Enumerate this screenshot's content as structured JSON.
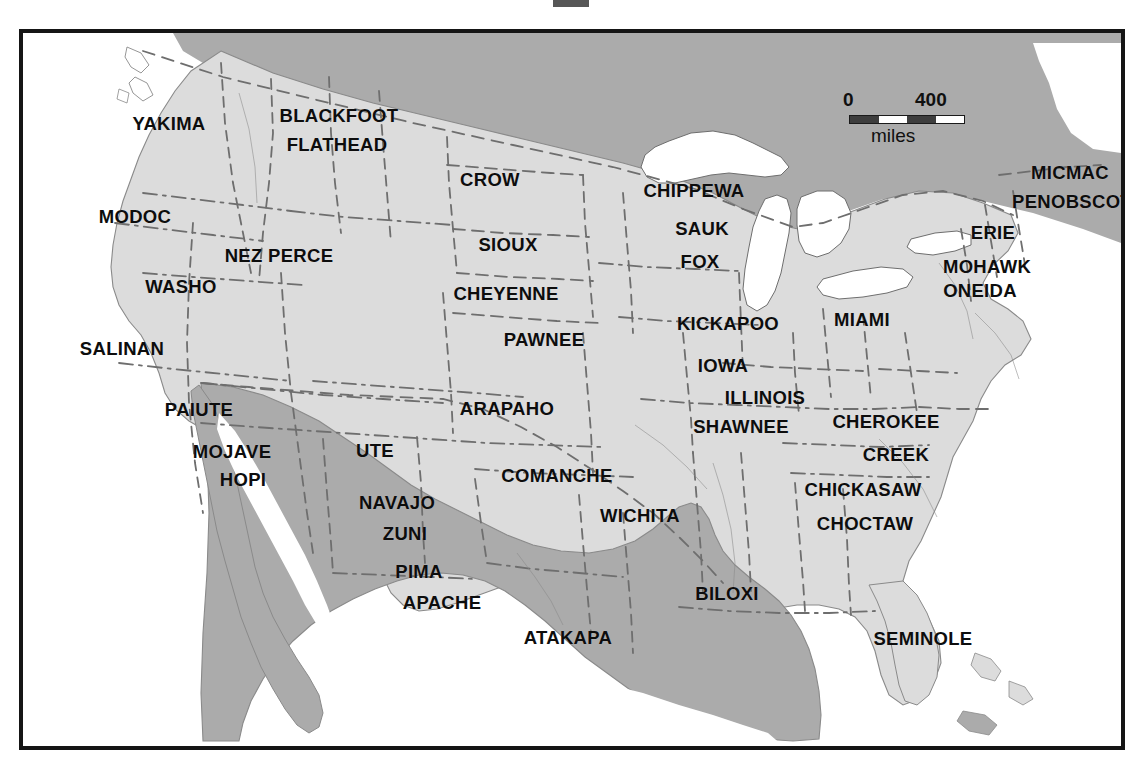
{
  "map": {
    "title_fragment": "",
    "frame": {
      "x": 19,
      "y": 29,
      "width": 1106,
      "height": 721
    },
    "colors": {
      "land_us": "#dcdcdc",
      "land_foreign": "#ababab",
      "water": "#ffffff",
      "border_line": "#6e6e6e",
      "frame": "#151515",
      "label_text": "#0d0d0d"
    },
    "scale": {
      "zero_label": "0",
      "max_label": "400",
      "units_label": "miles",
      "segments": [
        "dark",
        "light",
        "dark",
        "light"
      ]
    },
    "tribes": [
      {
        "name": "YAKIMA",
        "x": 146,
        "y": 91
      },
      {
        "name": "BLACKFOOT",
        "x": 316,
        "y": 83
      },
      {
        "name": "FLATHEAD",
        "x": 314,
        "y": 112
      },
      {
        "name": "CROW",
        "x": 467,
        "y": 147
      },
      {
        "name": "CHIPPEWA",
        "x": 671,
        "y": 158
      },
      {
        "name": "MICMAC",
        "x": 1047,
        "y": 140
      },
      {
        "name": "PENOBSCOT",
        "x": 1049,
        "y": 169
      },
      {
        "name": "MODOC",
        "x": 112,
        "y": 184
      },
      {
        "name": "SAUK",
        "x": 679,
        "y": 196
      },
      {
        "name": "ERIE",
        "x": 970,
        "y": 200
      },
      {
        "name": "NEZ PERCE",
        "x": 256,
        "y": 223
      },
      {
        "name": "SIOUX",
        "x": 485,
        "y": 212
      },
      {
        "name": "FOX",
        "x": 677,
        "y": 229
      },
      {
        "name": "MOHAWK",
        "x": 964,
        "y": 234
      },
      {
        "name": "WASHO",
        "x": 158,
        "y": 254
      },
      {
        "name": "CHEYENNE",
        "x": 483,
        "y": 261
      },
      {
        "name": "ONEIDA",
        "x": 957,
        "y": 258
      },
      {
        "name": "PAWNEE",
        "x": 521,
        "y": 307
      },
      {
        "name": "KICKAPOO",
        "x": 705,
        "y": 291
      },
      {
        "name": "MIAMI",
        "x": 839,
        "y": 287
      },
      {
        "name": "SALINAN",
        "x": 99,
        "y": 316
      },
      {
        "name": "IOWA",
        "x": 700,
        "y": 333
      },
      {
        "name": "ILLINOIS",
        "x": 742,
        "y": 365
      },
      {
        "name": "PAIUTE",
        "x": 176,
        "y": 377
      },
      {
        "name": "ARAPAHO",
        "x": 484,
        "y": 376
      },
      {
        "name": "SHAWNEE",
        "x": 718,
        "y": 394
      },
      {
        "name": "CHEROKEE",
        "x": 863,
        "y": 389
      },
      {
        "name": "MOJAVE",
        "x": 209,
        "y": 419
      },
      {
        "name": "UTE",
        "x": 352,
        "y": 418
      },
      {
        "name": "CREEK",
        "x": 873,
        "y": 422
      },
      {
        "name": "HOPI",
        "x": 220,
        "y": 447
      },
      {
        "name": "COMANCHE",
        "x": 534,
        "y": 443
      },
      {
        "name": "CHICKASAW",
        "x": 840,
        "y": 457
      },
      {
        "name": "NAVAJO",
        "x": 374,
        "y": 470
      },
      {
        "name": "WICHITA",
        "x": 617,
        "y": 483
      },
      {
        "name": "CHOCTAW",
        "x": 842,
        "y": 491
      },
      {
        "name": "ZUNI",
        "x": 382,
        "y": 501
      },
      {
        "name": "PIMA",
        "x": 396,
        "y": 539
      },
      {
        "name": "APACHE",
        "x": 419,
        "y": 570
      },
      {
        "name": "BILOXI",
        "x": 704,
        "y": 561
      },
      {
        "name": "ATAKAPA",
        "x": 545,
        "y": 605
      },
      {
        "name": "SEMINOLE",
        "x": 900,
        "y": 606
      }
    ]
  }
}
